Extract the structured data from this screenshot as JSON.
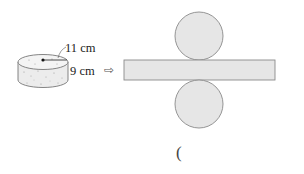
{
  "diagram": {
    "type": "cylinder-net",
    "cylinder": {
      "radius_label": "11 cm",
      "height_label": "9 cm"
    },
    "arrow_symbol": "⇨",
    "net": {
      "parts": [
        "top-circle",
        "lateral-rectangle",
        "bottom-circle"
      ],
      "fill_color": "#e6e6e6",
      "stroke_color": "#8a8a8a"
    },
    "answer_blank": {
      "open_paren": "("
    }
  }
}
